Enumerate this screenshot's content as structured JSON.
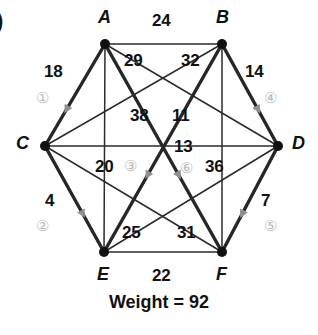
{
  "corner_marker": ")",
  "footer": {
    "text": "Weight = 92"
  },
  "graph": {
    "vertices": [
      {
        "id": "A",
        "label": "A",
        "x": 105,
        "y": 44
      },
      {
        "id": "B",
        "label": "B",
        "x": 222,
        "y": 44
      },
      {
        "id": "C",
        "label": "C",
        "x": 45,
        "y": 146
      },
      {
        "id": "D",
        "label": "D",
        "x": 278,
        "y": 146
      },
      {
        "id": "E",
        "label": "E",
        "x": 104,
        "y": 252
      },
      {
        "id": "F",
        "label": "F",
        "x": 222,
        "y": 252
      }
    ],
    "vertex_label_positions": [
      {
        "id": "A",
        "lx": 98,
        "ly": 8
      },
      {
        "id": "B",
        "lx": 216,
        "ly": 8
      },
      {
        "id": "C",
        "lx": 16,
        "ly": 134
      },
      {
        "id": "D",
        "lx": 292,
        "ly": 134
      },
      {
        "id": "E",
        "lx": 97,
        "ly": 265
      },
      {
        "id": "F",
        "lx": 216,
        "ly": 265
      }
    ],
    "edges": [
      {
        "from": "A",
        "to": "B",
        "weight": "24",
        "selected": false
      },
      {
        "from": "A",
        "to": "C",
        "weight": "18",
        "selected": true
      },
      {
        "from": "A",
        "to": "D",
        "weight": "32",
        "selected": false
      },
      {
        "from": "A",
        "to": "E",
        "weight": "20",
        "selected": false
      },
      {
        "from": "A",
        "to": "F",
        "weight": "38",
        "selected": true
      },
      {
        "from": "B",
        "to": "C",
        "weight": "29",
        "selected": false
      },
      {
        "from": "B",
        "to": "D",
        "weight": "14",
        "selected": true
      },
      {
        "from": "B",
        "to": "E",
        "weight": "11",
        "selected": true
      },
      {
        "from": "B",
        "to": "F",
        "weight": "36",
        "selected": false
      },
      {
        "from": "C",
        "to": "D",
        "weight": "13",
        "selected": false
      },
      {
        "from": "C",
        "to": "E",
        "weight": "4",
        "selected": true
      },
      {
        "from": "C",
        "to": "F",
        "weight": "31",
        "selected": false
      },
      {
        "from": "D",
        "to": "E",
        "weight": "25",
        "selected": false
      },
      {
        "from": "D",
        "to": "F",
        "weight": "7",
        "selected": true
      },
      {
        "from": "E",
        "to": "F",
        "weight": "22",
        "selected": false
      }
    ],
    "weight_label_positions": [
      {
        "text": "24",
        "x": 152,
        "y": 12
      },
      {
        "text": "29",
        "x": 124,
        "y": 52
      },
      {
        "text": "32",
        "x": 181,
        "y": 52
      },
      {
        "text": "18",
        "x": 44,
        "y": 63
      },
      {
        "text": "14",
        "x": 245,
        "y": 63
      },
      {
        "text": "38",
        "x": 130,
        "y": 107
      },
      {
        "text": "11",
        "x": 172,
        "y": 107
      },
      {
        "text": "13",
        "x": 174,
        "y": 138
      },
      {
        "text": "20",
        "x": 95,
        "y": 158
      },
      {
        "text": "36",
        "x": 205,
        "y": 158
      },
      {
        "text": "4",
        "x": 45,
        "y": 192
      },
      {
        "text": "7",
        "x": 261,
        "y": 192
      },
      {
        "text": "25",
        "x": 122,
        "y": 224
      },
      {
        "text": "31",
        "x": 177,
        "y": 224
      },
      {
        "text": "22",
        "x": 152,
        "y": 267
      }
    ],
    "circuit_markers": [
      {
        "number": "1",
        "glyph": "①",
        "x": 36,
        "y": 90
      },
      {
        "number": "2",
        "glyph": "②",
        "x": 36,
        "y": 218
      },
      {
        "number": "3",
        "glyph": "③",
        "x": 124,
        "y": 158
      },
      {
        "number": "4",
        "glyph": "④",
        "x": 264,
        "y": 90
      },
      {
        "number": "5",
        "glyph": "⑤",
        "x": 264,
        "y": 218
      },
      {
        "number": "6",
        "glyph": "⑥",
        "x": 180,
        "y": 160
      }
    ],
    "colors": {
      "edge": "#2b2b2b",
      "selected_edge": "#262626",
      "vertex": "#111111",
      "marker": "#b9b9b9",
      "arrow": "#8f8f8f",
      "background": "#ffffff"
    }
  },
  "chart_data": {
    "type": "diagram",
    "title": "Weight = 92",
    "nodes": [
      "A",
      "B",
      "C",
      "D",
      "E",
      "F"
    ],
    "edge_weights": {
      "A-B": 24,
      "A-C": 18,
      "A-D": 32,
      "A-E": 20,
      "A-F": 38,
      "B-C": 29,
      "B-D": 14,
      "B-E": 11,
      "B-F": 36,
      "C-D": 13,
      "C-E": 4,
      "C-F": 31,
      "D-E": 25,
      "D-F": 7,
      "E-F": 22
    },
    "circuit_order": [
      "1",
      "2",
      "3",
      "4",
      "5",
      "6"
    ],
    "circuit_edges": [
      "A-C",
      "C-E",
      "E-B",
      "B-D",
      "D-F",
      "F-A"
    ],
    "circuit_edge_weights": [
      18,
      4,
      11,
      14,
      7,
      38
    ],
    "total_weight": 92
  }
}
